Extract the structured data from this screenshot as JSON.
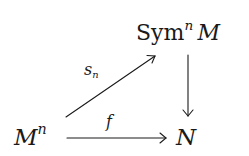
{
  "diagram": {
    "type": "commutative-diagram",
    "nodes": {
      "sym": {
        "base": "Sym",
        "sup": "n",
        "arg": "M"
      },
      "mn": {
        "base": "M",
        "sup": "n"
      },
      "n": {
        "base": "N"
      }
    },
    "edges": [
      {
        "from": "mn",
        "to": "sym",
        "label_base": "s",
        "label_sub": "n"
      },
      {
        "from": "mn",
        "to": "n",
        "label": "f"
      },
      {
        "from": "sym",
        "to": "n",
        "label": ""
      }
    ]
  }
}
